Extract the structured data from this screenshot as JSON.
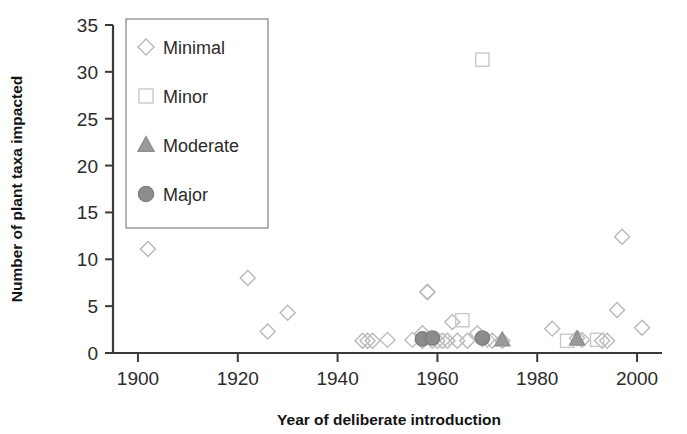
{
  "chart_data": {
    "type": "scatter",
    "title": "",
    "xlabel": "Year of deliberate introduction",
    "ylabel": "Number of plant taxa impacted",
    "xlim": [
      1895,
      2005
    ],
    "ylim": [
      0,
      35
    ],
    "xticks": [
      1900,
      1920,
      1940,
      1960,
      1980,
      2000
    ],
    "yticks": [
      0,
      5,
      10,
      15,
      20,
      25,
      30,
      35
    ],
    "grid": false,
    "legend_position": "upper-left-inside",
    "series": [
      {
        "name": "Minimal",
        "marker": "diamond",
        "color": "#b9b9b9",
        "fill": "none",
        "points": [
          [
            1902,
            11.1
          ],
          [
            1922,
            8.0
          ],
          [
            1926,
            2.3
          ],
          [
            1930,
            4.3
          ],
          [
            1945,
            1.3
          ],
          [
            1946,
            1.3
          ],
          [
            1947,
            1.3
          ],
          [
            1950,
            1.4
          ],
          [
            1955,
            1.4
          ],
          [
            1957,
            2.1
          ],
          [
            1957,
            1.3
          ],
          [
            1958,
            6.5
          ],
          [
            1958,
            6.5
          ],
          [
            1959,
            1.3
          ],
          [
            1960,
            1.3
          ],
          [
            1961,
            1.3
          ],
          [
            1962,
            1.3
          ],
          [
            1963,
            3.3
          ],
          [
            1964,
            1.3
          ],
          [
            1966,
            1.3
          ],
          [
            1968,
            2.1
          ],
          [
            1969,
            1.5
          ],
          [
            1970,
            1.4
          ],
          [
            1971,
            1.3
          ],
          [
            1973,
            1.3
          ],
          [
            1983,
            2.6
          ],
          [
            1988,
            1.6
          ],
          [
            1989,
            1.4
          ],
          [
            1993,
            1.3
          ],
          [
            1994,
            1.3
          ],
          [
            1996,
            4.6
          ],
          [
            1997,
            12.4
          ],
          [
            2001,
            2.7
          ]
        ]
      },
      {
        "name": "Minor",
        "marker": "square",
        "color": "#c9c9c9",
        "fill": "none",
        "points": [
          [
            1960,
            1.3
          ],
          [
            1961,
            1.3
          ],
          [
            1965,
            3.5
          ],
          [
            1969,
            31.3
          ],
          [
            1986,
            1.3
          ],
          [
            1992,
            1.4
          ]
        ]
      },
      {
        "name": "Moderate",
        "marker": "triangle",
        "color": "#8e8e8e",
        "fill": "#9a9a9a",
        "points": [
          [
            1973,
            1.4
          ],
          [
            1988,
            1.5
          ]
        ]
      },
      {
        "name": "Major",
        "marker": "circle",
        "color": "#7e7e7e",
        "fill": "#8c8c8c",
        "points": [
          [
            1957,
            1.5
          ],
          [
            1959,
            1.6
          ],
          [
            1969,
            1.6
          ]
        ]
      }
    ]
  },
  "axes": {
    "y_tick_labels": [
      "35",
      "30",
      "25",
      "20",
      "15",
      "10",
      "5",
      "0"
    ],
    "x_tick_labels": [
      "1900",
      "1920",
      "1940",
      "1960",
      "1980",
      "2000"
    ],
    "x_axis_title": "Year of deliberate introduction",
    "y_axis_title": "Number of plant taxa impacted"
  },
  "legend": {
    "items": [
      {
        "label": "Minimal",
        "marker": "diamond-icon"
      },
      {
        "label": "Minor",
        "marker": "square-icon"
      },
      {
        "label": "Moderate",
        "marker": "triangle-icon"
      },
      {
        "label": "Major",
        "marker": "circle-icon"
      }
    ]
  },
  "colors": {
    "axis": "#3a3a3a",
    "text": "#2b2b2b",
    "minimal": "#b9b9b9",
    "minor": "#c9c9c9",
    "moderate": "#9a9a9a",
    "major": "#8c8c8c",
    "legend_border": "#8a8a8a"
  }
}
